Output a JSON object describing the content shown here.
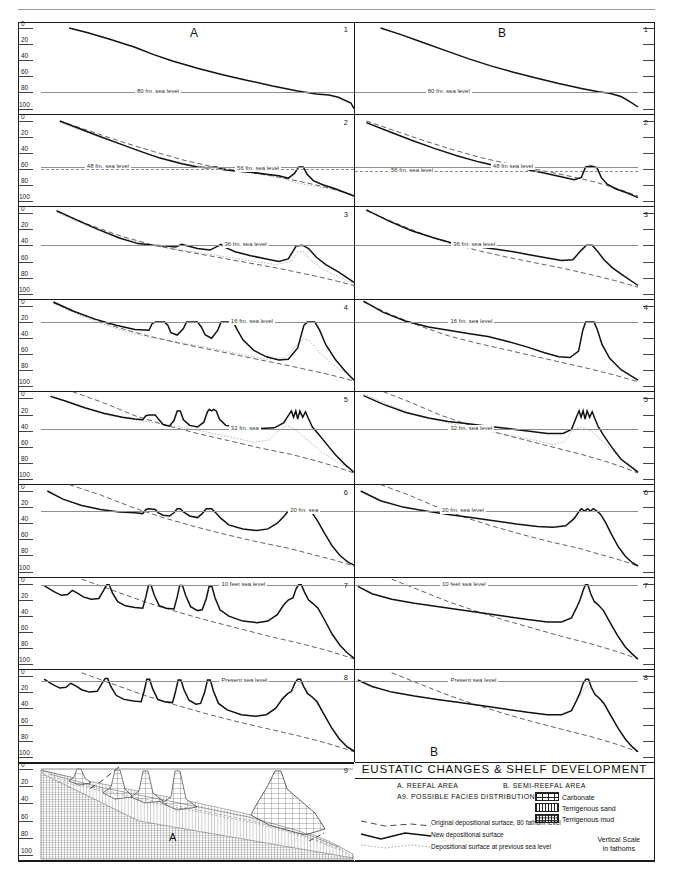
{
  "figure": {
    "title": "EUSTATIC CHANGES & SHELF DEVELOPMENT",
    "header_ghost": "",
    "column_a_letter": "A",
    "column_b_letter": "B",
    "bottom_b_letter": "B",
    "bottom_a_letter": "A"
  },
  "axis": {
    "labels": [
      "0",
      "20",
      "40",
      "60",
      "80",
      "100"
    ],
    "values": [
      0,
      20,
      40,
      60,
      80,
      100
    ],
    "unit": "fathoms"
  },
  "panels_a": [
    {
      "num": "1",
      "labels": [
        {
          "text": "80 fm. sea level",
          "depth": 80,
          "style": "solid",
          "x": 0.3
        }
      ]
    },
    {
      "num": "2",
      "labels": [
        {
          "text": "48 fm. sea level",
          "depth": 57,
          "style": "solid",
          "x": 0.14
        },
        {
          "text": "56 fm. sea level",
          "depth": 60,
          "style": "dash",
          "x": 0.62
        }
      ]
    },
    {
      "num": "3",
      "labels": [
        {
          "text": "36 fm. sea level",
          "depth": 40,
          "style": "solid",
          "x": 0.58
        }
      ]
    },
    {
      "num": "4",
      "labels": [
        {
          "text": "16 fm. sea level",
          "depth": 20,
          "style": "solid",
          "x": 0.6
        }
      ]
    },
    {
      "num": "5",
      "labels": [
        {
          "text": "32 fm. sea",
          "text2": "Level",
          "depth": 38,
          "style": "solid",
          "x": 0.6
        }
      ]
    },
    {
      "num": "6",
      "labels": [
        {
          "text": "20 fm. sea",
          "text2": "level",
          "depth": 25,
          "style": "solid",
          "x": 0.79
        }
      ]
    },
    {
      "num": "7",
      "labels": [
        {
          "text": "10 feet sea level",
          "depth": 2,
          "style": "solid",
          "x": 0.57
        }
      ]
    },
    {
      "num": "8",
      "labels": [
        {
          "text": "Present sea level",
          "depth": 6,
          "style": "solid",
          "x": 0.57
        }
      ]
    },
    {
      "num": "9",
      "labels": []
    }
  ],
  "panels_b": [
    {
      "num": "1",
      "labels": [
        {
          "text": "80 fm. sea level",
          "depth": 80,
          "style": "solid",
          "x": 0.25
        }
      ]
    },
    {
      "num": "2",
      "labels": [
        {
          "text": "56 fm. sea level",
          "depth": 62,
          "style": "dash",
          "x": 0.12
        },
        {
          "text": "48 fm sea level",
          "depth": 57,
          "style": "solid",
          "x": 0.48
        }
      ]
    },
    {
      "num": "3",
      "labels": [
        {
          "text": "36 fm. sea level",
          "depth": 40,
          "style": "solid",
          "x": 0.34
        }
      ]
    },
    {
      "num": "4",
      "labels": [
        {
          "text": "16 fm. sea level",
          "depth": 20,
          "style": "solid",
          "x": 0.33
        }
      ]
    },
    {
      "num": "5",
      "labels": [
        {
          "text": "32 fm. sea level",
          "depth": 38,
          "style": "solid",
          "x": 0.33
        }
      ]
    },
    {
      "num": "6",
      "labels": [
        {
          "text": "20 fm. sea level",
          "depth": 25,
          "style": "solid",
          "x": 0.3
        }
      ]
    },
    {
      "num": "7",
      "labels": [
        {
          "text": "10 feet sea level",
          "depth": 2,
          "style": "solid",
          "x": 0.3
        }
      ]
    },
    {
      "num": "8",
      "labels": [
        {
          "text": "Present sea level",
          "depth": 6,
          "style": "solid",
          "x": 0.33
        }
      ]
    }
  ],
  "legend": {
    "title": "EUSTATIC CHANGES & SHELF DEVELOPMENT",
    "row_a": "A.  REEFAL  AREA",
    "row_b": "B. SEMI-REEFAL AREA",
    "row_a9": "A9. POSSIBLE FACIES DISTRIBUTION",
    "facies": [
      {
        "name": "Carbonate",
        "pattern": "carbonate"
      },
      {
        "name": "Terrigenous sand",
        "pattern": "terrigenous-sand"
      },
      {
        "name": "Terrigenous mud",
        "pattern": "terrigenous-mud"
      }
    ],
    "keys": [
      {
        "label": "Original depositional surface, 80 fathom level",
        "style": "dashed"
      },
      {
        "label": "New depositional surface",
        "style": "solid"
      },
      {
        "label": "Depositional surface at previous sea level",
        "style": "dotted"
      }
    ],
    "vertical_scale_line1": "Vertical  Scale",
    "vertical_scale_line2": "in fathoms"
  },
  "chart_data": {
    "type": "line",
    "title": "EUSTATIC CHANGES & SHELF DEVELOPMENT",
    "xlabel": "",
    "ylabel": "Depth (fathoms)",
    "ylim": [
      0,
      100
    ],
    "grid": false,
    "legend_position": "bottom-right",
    "series_styles": {
      "new_depositional_surface": "solid-heavy",
      "original_depositional_surface_80fm": "dashed",
      "depositional_surface_previous_sea_level": "dotted"
    },
    "sequence_a": [
      {
        "stage": 1,
        "sea_level_fm": 80,
        "reefs": 0
      },
      {
        "stage": 2,
        "sea_level_fm": 48,
        "previous_sea_level_fm": 56,
        "reefs": 1
      },
      {
        "stage": 3,
        "sea_level_fm": 36,
        "reefs": 3
      },
      {
        "stage": 4,
        "sea_level_fm": 16,
        "reefs": 4
      },
      {
        "stage": 5,
        "sea_level_fm": 32,
        "reefs": 4
      },
      {
        "stage": 6,
        "sea_level_fm": 20,
        "reefs": 4
      },
      {
        "stage": 7,
        "sea_level_ft": 10,
        "reefs": 6
      },
      {
        "stage": 8,
        "sea_level_fm": 0,
        "reefs": 6
      },
      {
        "stage": 9,
        "facies_section": true
      }
    ],
    "sequence_b": [
      {
        "stage": 1,
        "sea_level_fm": 80,
        "reefs": 0
      },
      {
        "stage": 2,
        "sea_level_fm": 48,
        "previous_sea_level_fm": 56,
        "reefs": 1
      },
      {
        "stage": 3,
        "sea_level_fm": 36,
        "reefs": 1
      },
      {
        "stage": 4,
        "sea_level_fm": 16,
        "reefs": 1
      },
      {
        "stage": 5,
        "sea_level_fm": 32,
        "reefs": 1
      },
      {
        "stage": 6,
        "sea_level_fm": 20,
        "reefs": 1
      },
      {
        "stage": 7,
        "sea_level_ft": 10,
        "reefs": 1
      },
      {
        "stage": 8,
        "sea_level_fm": 0,
        "reefs": 1
      }
    ]
  }
}
